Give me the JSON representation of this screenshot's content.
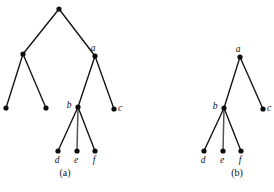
{
  "figure": {
    "background_color": "#ffffff",
    "ink_color": "#111111",
    "accent_edge_color": "#555555",
    "node_radius": 2.6,
    "panels": [
      {
        "id": "panel-a",
        "caption": "(a)",
        "caption_x": 65,
        "caption_y": 176,
        "nodes": [
          {
            "id": "root",
            "label": "",
            "x": 59,
            "y": 9,
            "label_dx": 0,
            "label_dy": 0
          },
          {
            "id": "left",
            "label": "",
            "x": 23,
            "y": 54,
            "label_dx": 0,
            "label_dy": 0
          },
          {
            "id": "a",
            "label": "a",
            "x": 95,
            "y": 56,
            "label_dx": -2,
            "label_dy": -5
          },
          {
            "id": "ll",
            "label": "",
            "x": 6,
            "y": 108,
            "label_dx": 0,
            "label_dy": 0
          },
          {
            "id": "lr",
            "label": "",
            "x": 46,
            "y": 108,
            "label_dx": 0,
            "label_dy": 0
          },
          {
            "id": "b",
            "label": "b",
            "x": 78,
            "y": 107,
            "label_dx": -9,
            "label_dy": 1
          },
          {
            "id": "c",
            "label": "c",
            "x": 114,
            "y": 109,
            "label_dx": 6,
            "label_dy": 2
          },
          {
            "id": "d",
            "label": "d",
            "x": 58,
            "y": 151,
            "label_dx": -1,
            "label_dy": 12
          },
          {
            "id": "e",
            "label": "e",
            "x": 77,
            "y": 151,
            "label_dx": -1,
            "label_dy": 12
          },
          {
            "id": "f",
            "label": "f",
            "x": 95,
            "y": 151,
            "label_dx": -1,
            "label_dy": 12
          }
        ],
        "edges": [
          {
            "from": "root",
            "to": "left",
            "style": "normal"
          },
          {
            "from": "root",
            "to": "a",
            "style": "normal"
          },
          {
            "from": "left",
            "to": "ll",
            "style": "normal"
          },
          {
            "from": "left",
            "to": "lr",
            "style": "normal"
          },
          {
            "from": "a",
            "to": "b",
            "style": "normal"
          },
          {
            "from": "a",
            "to": "c",
            "style": "normal"
          },
          {
            "from": "b",
            "to": "d",
            "style": "normal"
          },
          {
            "from": "b",
            "to": "e",
            "style": "accent"
          },
          {
            "from": "b",
            "to": "f",
            "style": "normal"
          }
        ]
      },
      {
        "id": "panel-b",
        "caption": "(b)",
        "caption_x": 237,
        "caption_y": 176,
        "nodes": [
          {
            "id": "a",
            "label": "a",
            "x": 240,
            "y": 57,
            "label_dx": -2,
            "label_dy": -5
          },
          {
            "id": "b",
            "label": "b",
            "x": 224,
            "y": 108,
            "label_dx": -9,
            "label_dy": 1
          },
          {
            "id": "c",
            "label": "c",
            "x": 263,
            "y": 109,
            "label_dx": 6,
            "label_dy": 2
          },
          {
            "id": "d",
            "label": "d",
            "x": 204,
            "y": 151,
            "label_dx": -1,
            "label_dy": 12
          },
          {
            "id": "e",
            "label": "e",
            "x": 223,
            "y": 151,
            "label_dx": -1,
            "label_dy": 12
          },
          {
            "id": "f",
            "label": "f",
            "x": 241,
            "y": 151,
            "label_dx": -1,
            "label_dy": 12
          }
        ],
        "edges": [
          {
            "from": "a",
            "to": "b",
            "style": "normal"
          },
          {
            "from": "a",
            "to": "c",
            "style": "normal"
          },
          {
            "from": "b",
            "to": "d",
            "style": "normal"
          },
          {
            "from": "b",
            "to": "e",
            "style": "accent"
          },
          {
            "from": "b",
            "to": "f",
            "style": "normal"
          }
        ]
      }
    ]
  }
}
